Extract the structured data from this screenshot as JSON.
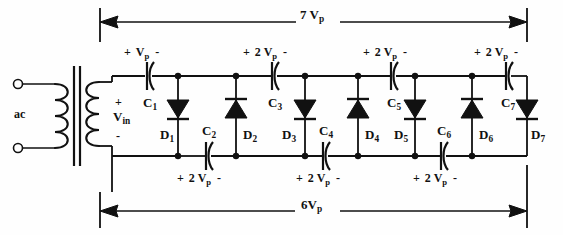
{
  "diagram": {
    "source_label": "ac",
    "input_label": "V",
    "input_sub": "in",
    "input_plus": "+",
    "input_minus": "-",
    "top_dimension": {
      "value": "7 V",
      "sub": "p",
      "direction": "left-arrow"
    },
    "bottom_dimension": {
      "value": "6V",
      "sub": "p",
      "direction": "right-arrow"
    },
    "stroke": "#111111",
    "background": "#fefefe"
  },
  "capacitors": [
    {
      "name": "C",
      "sub": "1",
      "label_x": 143,
      "label_y": 96,
      "cx": 147,
      "cy": 76,
      "rail": "top",
      "volt_plus": "+",
      "volt_value": "V",
      "volt_sub": "p",
      "volt_minus": "-",
      "volt_x": 124,
      "volt_y": 46
    },
    {
      "name": "C",
      "sub": "2",
      "label_x": 202,
      "label_y": 124,
      "cx": 206,
      "cy": 156,
      "rail": "bottom",
      "volt_plus": "+",
      "volt_value": "2 V",
      "volt_sub": "p",
      "volt_minus": "-",
      "volt_x": 177,
      "volt_y": 172
    },
    {
      "name": "C",
      "sub": "3",
      "label_x": 268,
      "label_y": 96,
      "cx": 272,
      "cy": 76,
      "rail": "top",
      "volt_plus": "+",
      "volt_value": "2 V",
      "volt_sub": "p",
      "volt_minus": "-",
      "volt_x": 243,
      "volt_y": 46
    },
    {
      "name": "C",
      "sub": "4",
      "label_x": 319,
      "label_y": 124,
      "cx": 323,
      "cy": 156,
      "rail": "bottom",
      "volt_plus": "+",
      "volt_value": "2 V",
      "volt_sub": "p",
      "volt_minus": "-",
      "volt_x": 296,
      "volt_y": 172
    },
    {
      "name": "C",
      "sub": "5",
      "label_x": 387,
      "label_y": 96,
      "cx": 391,
      "cy": 76,
      "rail": "top",
      "volt_plus": "+",
      "volt_value": "2 V",
      "volt_sub": "p",
      "volt_minus": "-",
      "volt_x": 363,
      "volt_y": 46
    },
    {
      "name": "C",
      "sub": "6",
      "label_x": 437,
      "label_y": 124,
      "cx": 441,
      "cy": 156,
      "rail": "bottom",
      "volt_plus": "+",
      "volt_value": "2 V",
      "volt_sub": "p",
      "volt_minus": "-",
      "volt_x": 413,
      "volt_y": 172
    },
    {
      "name": "C",
      "sub": "7",
      "label_x": 501,
      "label_y": 96,
      "cx": 506,
      "cy": 76,
      "rail": "top",
      "volt_plus": "+",
      "volt_value": "2 V",
      "volt_sub": "p",
      "volt_minus": "-",
      "volt_x": 474,
      "volt_y": 46
    }
  ],
  "diodes": [
    {
      "name": "D",
      "sub": "1",
      "x": 178,
      "dir": "down",
      "label_x": 160,
      "label_y": 128
    },
    {
      "name": "D",
      "sub": "2",
      "x": 236,
      "dir": "up",
      "label_x": 243,
      "label_y": 128
    },
    {
      "name": "D",
      "sub": "3",
      "x": 305,
      "dir": "down",
      "label_x": 282,
      "label_y": 128
    },
    {
      "name": "D",
      "sub": "4",
      "x": 358,
      "dir": "up",
      "label_x": 365,
      "label_y": 128
    },
    {
      "name": "D",
      "sub": "5",
      "x": 415,
      "dir": "down",
      "label_x": 394,
      "label_y": 128
    },
    {
      "name": "D",
      "sub": "6",
      "x": 472,
      "dir": "up",
      "label_x": 479,
      "label_y": 128
    },
    {
      "name": "D",
      "sub": "7",
      "x": 527,
      "dir": "down",
      "label_x": 531,
      "label_y": 128
    }
  ]
}
